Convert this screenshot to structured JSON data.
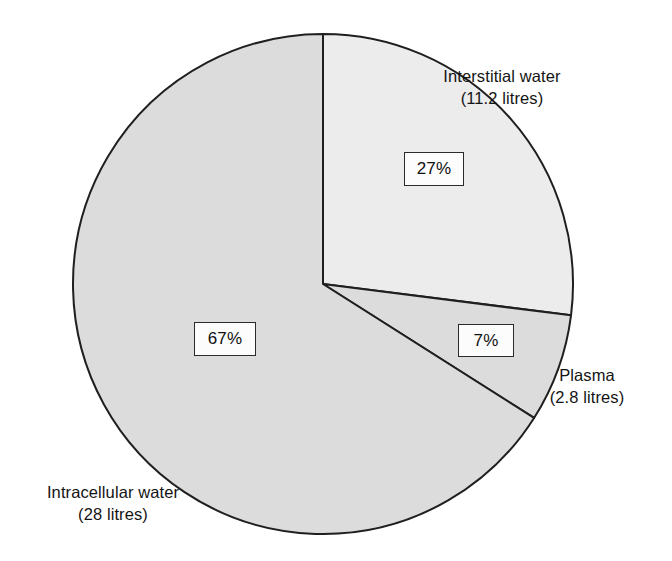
{
  "chart_data": {
    "type": "pie",
    "title": "",
    "subtitle": "",
    "xlabel": "",
    "ylabel": "",
    "legend_position": "none",
    "grid": false,
    "total_litres": 42,
    "units": "litres",
    "center": {
      "x": 323,
      "y": 284
    },
    "radius": 250,
    "start_angle_deg": 0,
    "direction": "clockwise",
    "categories": [
      "Interstitial water",
      "Plasma",
      "Intracellular water"
    ],
    "values": [
      27,
      7,
      67
    ],
    "labels": [
      "27%",
      "7%",
      "67%"
    ],
    "slices": [
      {
        "name": "Interstitial water",
        "percent": 27,
        "percent_label": "27%",
        "litres": 11.2,
        "litres_label": "(11.2 litres)",
        "color": "#ececec",
        "stroke": "#1f1f1f",
        "start_angle_deg": 0,
        "end_angle_deg": 97.2
      },
      {
        "name": "Plasma",
        "percent": 7,
        "percent_label": "7%",
        "litres": 2.8,
        "litres_label": "(2.8 litres)",
        "color": "#dcdcdc",
        "stroke": "#1f1f1f",
        "start_angle_deg": 97.2,
        "end_angle_deg": 122.4
      },
      {
        "name": "Intracellular water",
        "percent": 67,
        "percent_label": "67%",
        "litres": 28,
        "litres_label": "(28 litres)",
        "color": "#dcdcdc",
        "stroke": "#1f1f1f",
        "start_angle_deg": 122.4,
        "end_angle_deg": 360
      }
    ]
  },
  "labels": {
    "interstitial": {
      "name": "Interstitial water",
      "value": "(11.2 litres)"
    },
    "plasma": {
      "name": "Plasma",
      "value": "(2.8 litres)"
    },
    "intracellular": {
      "name": "Intracellular water",
      "value": "(28 litres)"
    }
  },
  "callouts": {
    "interstitial_pct": "27%",
    "intracellular_pct": "67%",
    "plasma_pct": "7%"
  },
  "colors": {
    "background": "#ffffff",
    "outline": "#1f1f1f",
    "slice_light": "#ececec",
    "slice_mid": "#dcdcdc",
    "text": "#141414",
    "box_fill": "#fcfcfc",
    "box_border": "#2a2a2a"
  }
}
